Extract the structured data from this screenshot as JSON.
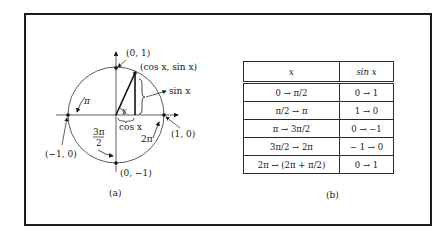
{
  "figure": {
    "panel_a": {
      "caption": "(a)",
      "points": {
        "top": "(0, 1)",
        "bottom": "(0, −1)",
        "left": "(−1, 0)",
        "right": "(1, 0)",
        "on_circle": "(cos x, sin x)"
      },
      "labels": {
        "sin": "sin x",
        "cos": "cos x",
        "angle": "x",
        "pi": "π",
        "three_pi_over_2_num": "3π",
        "three_pi_over_2_den": "2",
        "two_pi": "2π"
      }
    },
    "panel_b": {
      "caption": "(b)",
      "headers": [
        "x",
        "sin x"
      ],
      "rows": [
        [
          "0 → π/2",
          "0 → 1"
        ],
        [
          "π/2 → π",
          "1 → 0"
        ],
        [
          "π → 3π/2",
          "0 → −1"
        ],
        [
          "3π/2 → 2π",
          "− 1 → 0"
        ],
        [
          "2π → (2π + π/2)",
          "0 → 1"
        ]
      ]
    }
  }
}
